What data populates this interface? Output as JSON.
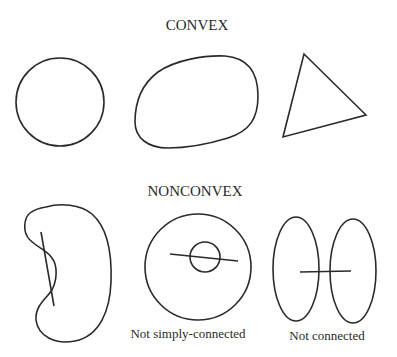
{
  "diagram": {
    "sections": [
      {
        "heading": "CONVEX",
        "figures": [
          {
            "kind": "circle",
            "caption": ""
          },
          {
            "kind": "rounded-blob",
            "caption": ""
          },
          {
            "kind": "triangle",
            "caption": ""
          }
        ]
      },
      {
        "heading": "NONCONVEX",
        "figures": [
          {
            "kind": "kidney-shape-with-chord",
            "caption": ""
          },
          {
            "kind": "annulus-with-chord",
            "caption": "Not simply-connected"
          },
          {
            "kind": "two-ellipses-with-chord",
            "caption": "Not connected"
          }
        ]
      }
    ],
    "stroke_color": "#2a2a2a",
    "background_color": "#ffffff"
  }
}
